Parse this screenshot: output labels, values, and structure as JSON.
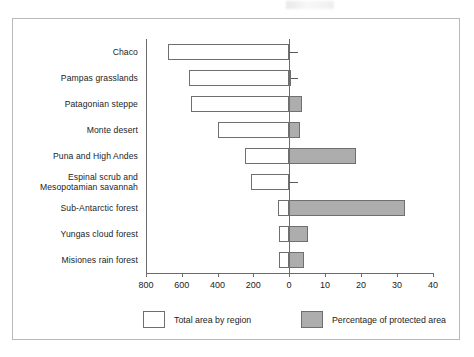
{
  "chart_data": {
    "type": "bar",
    "orientation": "horizontal",
    "title": "",
    "subtitle": "",
    "xlabel": "",
    "ylabel": "",
    "grid": false,
    "legend_position": "bottom",
    "categories": [
      "Chaco",
      "Pampas grasslands",
      "Patagonian steppe",
      "Monte desert",
      "Puna and High Andes",
      "Espinal scrub and\nMesopotamian savannah",
      "Sub-Antarctic forest",
      "Yungas cloud forest",
      "Misiones rain forest"
    ],
    "series": [
      {
        "name": "Total area by region",
        "axis": "left",
        "values": [
          676,
          559,
          548,
          397,
          246,
          212,
          61,
          56,
          56
        ]
      },
      {
        "name": "Percentage of protected area",
        "axis": "right",
        "values": [
          0.4,
          0.5,
          3.6,
          3.1,
          18.6,
          0.2,
          32.2,
          5.3,
          4.2
        ]
      }
    ],
    "left_axis": {
      "label": "",
      "ticks": [
        800,
        600,
        400,
        200,
        0
      ],
      "tick_labels": [
        "800",
        "600",
        "400",
        "200",
        "0"
      ],
      "range": [
        800,
        0
      ],
      "direction": "reversed"
    },
    "right_axis": {
      "label": "",
      "ticks": [
        0,
        10,
        20,
        30,
        40
      ],
      "tick_labels": [
        "0",
        "10",
        "20",
        "30",
        "40"
      ],
      "range": [
        0,
        40
      ],
      "direction": "normal"
    },
    "axis_tick_labels": [
      "800",
      "600",
      "400",
      "200",
      "0",
      "10",
      "20",
      "30",
      "40"
    ]
  },
  "legend": {
    "items": [
      {
        "label": "Total area by region",
        "swatch": "white",
        "color": "#ffffff"
      },
      {
        "label": "Percentage of protected area",
        "swatch": "gray",
        "color": "#adadad"
      }
    ]
  },
  "colors": {
    "total_bar_fill": "#ffffff",
    "percentage_bar_fill": "#adadad",
    "bar_outline": "#6f6f6f",
    "axis": "#6b6b6b",
    "frame": "#b9b9b9",
    "text": "#1c1c1c",
    "background": "#ffffff"
  }
}
